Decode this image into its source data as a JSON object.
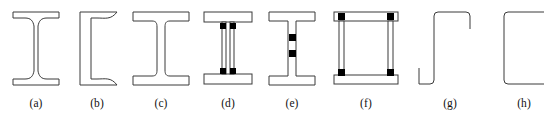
{
  "figure": {
    "background_color": "#ffffff",
    "stroke_color": "#3a3a3a",
    "fill_color": "#ffffff",
    "fastener_color": "#000000",
    "caption_color": "#111111",
    "panel_count": 8
  },
  "panels": [
    {
      "id": "panel-a",
      "label": "(a)",
      "shape_name": "i-beam-tapered-flange",
      "x": 5,
      "width": 62
    },
    {
      "id": "panel-b",
      "label": "(b)",
      "shape_name": "channel-tapered-flange",
      "x": 67,
      "width": 60
    },
    {
      "id": "panel-c",
      "label": "(c)",
      "shape_name": "wide-flange-i-beam",
      "x": 127,
      "width": 68
    },
    {
      "id": "panel-d",
      "label": "(d)",
      "shape_name": "built-up-plate-girder-bolted",
      "x": 195,
      "width": 66
    },
    {
      "id": "panel-e",
      "label": "(e)",
      "shape_name": "i-beam-web-bolted",
      "x": 261,
      "width": 62
    },
    {
      "id": "panel-f",
      "label": "(f)",
      "shape_name": "box-girder-bolted",
      "x": 323,
      "width": 86
    },
    {
      "id": "panel-g",
      "label": "(g)",
      "shape_name": "lipped-zed-section",
      "x": 409,
      "width": 82
    },
    {
      "id": "panel-h",
      "label": "(h)",
      "shape_name": "cold-formed-channel",
      "x": 491,
      "width": 66
    }
  ]
}
